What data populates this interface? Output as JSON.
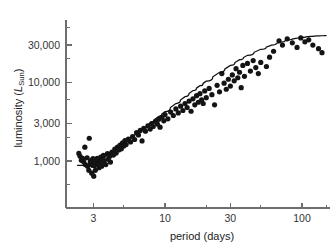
{
  "chart_data": {
    "type": "scatter",
    "title": "",
    "subtitle": "",
    "xlabel": "period (days)",
    "ylabel": "luminosity (L_Sun)",
    "ylabel_parts": {
      "prefix": "luminosity (",
      "symbol": "L",
      "subscript": "Sun",
      "suffix": ")"
    },
    "xscale": "log",
    "yscale": "log",
    "xlim": [
      2.1,
      160
    ],
    "ylim": [
      330,
      62000
    ],
    "grid": false,
    "legend": null,
    "legend_position": "none",
    "xticks": [
      3,
      10,
      30,
      100
    ],
    "xtick_labels": [
      "3",
      "10",
      "30",
      "100"
    ],
    "xminor_ticks": [
      5,
      20,
      50,
      150
    ],
    "yticks": [
      1000,
      3000,
      10000,
      30000
    ],
    "ytick_labels": [
      "1,000",
      "3,000",
      "10,000",
      "30,000"
    ],
    "yminor_ticks": [
      500,
      2000,
      6000,
      20000,
      50000
    ],
    "point_color": "#141414",
    "curve_color": "#111111",
    "axis_color": "#6e6e6e",
    "point_radius": 2.6,
    "series": [
      {
        "name": "Cepheid variables",
        "marker": "circle",
        "points": [
          [
            2.35,
            1250
          ],
          [
            2.4,
            1150
          ],
          [
            2.45,
            1020
          ],
          [
            2.5,
            1080
          ],
          [
            2.55,
            980
          ],
          [
            2.6,
            1500
          ],
          [
            2.62,
            900
          ],
          [
            2.7,
            1100
          ],
          [
            2.72,
            860
          ],
          [
            2.78,
            760
          ],
          [
            2.8,
            1950
          ],
          [
            2.85,
            980
          ],
          [
            2.88,
            930
          ],
          [
            2.9,
            1020
          ],
          [
            2.92,
            700
          ],
          [
            2.95,
            880
          ],
          [
            2.98,
            1070
          ],
          [
            3.0,
            950
          ],
          [
            3.02,
            640
          ],
          [
            3.05,
            870
          ],
          [
            3.08,
            1010
          ],
          [
            3.1,
            760
          ],
          [
            3.15,
            930
          ],
          [
            3.2,
            1080
          ],
          [
            3.25,
            900
          ],
          [
            3.3,
            820
          ],
          [
            3.35,
            1000
          ],
          [
            3.4,
            1120
          ],
          [
            3.45,
            860
          ],
          [
            3.5,
            950
          ],
          [
            3.55,
            1180
          ],
          [
            3.6,
            1010
          ],
          [
            3.7,
            900
          ],
          [
            3.8,
            1240
          ],
          [
            3.85,
            1050
          ],
          [
            3.95,
            1150
          ],
          [
            4.0,
            970
          ],
          [
            4.1,
            1300
          ],
          [
            4.2,
            1190
          ],
          [
            4.3,
            1420
          ],
          [
            4.4,
            1260
          ],
          [
            4.5,
            1500
          ],
          [
            4.6,
            1380
          ],
          [
            4.7,
            1600
          ],
          [
            4.8,
            1430
          ],
          [
            4.9,
            1700
          ],
          [
            5.0,
            1550
          ],
          [
            5.1,
            1820
          ],
          [
            5.2,
            1620
          ],
          [
            5.4,
            1900
          ],
          [
            5.6,
            1750
          ],
          [
            5.8,
            2050
          ],
          [
            6.0,
            1880
          ],
          [
            6.2,
            2300
          ],
          [
            6.4,
            2150
          ],
          [
            6.6,
            2450
          ],
          [
            6.8,
            1800
          ],
          [
            7.0,
            2600
          ],
          [
            7.2,
            2400
          ],
          [
            7.5,
            2800
          ],
          [
            7.8,
            2550
          ],
          [
            8.0,
            3000
          ],
          [
            8.2,
            2750
          ],
          [
            8.5,
            3200
          ],
          [
            8.8,
            2950
          ],
          [
            9.0,
            3400
          ],
          [
            9.2,
            2700
          ],
          [
            9.5,
            3600
          ],
          [
            9.8,
            3250
          ],
          [
            10.0,
            3900
          ],
          [
            10.5,
            3450
          ],
          [
            11.0,
            4200
          ],
          [
            11.5,
            3800
          ],
          [
            12.0,
            4600
          ],
          [
            12.5,
            4100
          ],
          [
            13.0,
            5000
          ],
          [
            13.5,
            4400
          ],
          [
            14.0,
            5400
          ],
          [
            14.5,
            4800
          ],
          [
            15.0,
            5800
          ],
          [
            15.5,
            4300
          ],
          [
            16.0,
            6200
          ],
          [
            16.5,
            5200
          ],
          [
            17.0,
            6800
          ],
          [
            17.5,
            5600
          ],
          [
            18.0,
            7200
          ],
          [
            18.5,
            6000
          ],
          [
            19.0,
            5400
          ],
          [
            19.5,
            7800
          ],
          [
            20.0,
            6400
          ],
          [
            21.0,
            8400
          ],
          [
            22.0,
            7000
          ],
          [
            23.0,
            5200
          ],
          [
            24.0,
            9200
          ],
          [
            25.0,
            7600
          ],
          [
            26.0,
            13000
          ],
          [
            27.0,
            9800
          ],
          [
            28.0,
            8200
          ],
          [
            29.0,
            11000
          ],
          [
            30.0,
            9000
          ],
          [
            31.0,
            12500
          ],
          [
            32.0,
            10500
          ],
          [
            33.0,
            15000
          ],
          [
            34.0,
            11500
          ],
          [
            35.0,
            13500
          ],
          [
            36.0,
            8600
          ],
          [
            37.0,
            16500
          ],
          [
            38.0,
            12000
          ],
          [
            40.0,
            17500
          ],
          [
            42.0,
            14000
          ],
          [
            44.0,
            19000
          ],
          [
            46.0,
            15500
          ],
          [
            48.0,
            13000
          ],
          [
            50.0,
            18000
          ],
          [
            55.0,
            16000
          ],
          [
            58.0,
            21000
          ],
          [
            62.0,
            25000
          ],
          [
            68.0,
            34000
          ],
          [
            72.0,
            30000
          ],
          [
            78.0,
            36000
          ],
          [
            85.0,
            32000
          ],
          [
            92.0,
            28000
          ],
          [
            98.0,
            37000
          ],
          [
            105.0,
            33000
          ],
          [
            112.0,
            35000
          ],
          [
            120.0,
            30000
          ],
          [
            132.0,
            27000
          ],
          [
            140.0,
            24000
          ]
        ]
      }
    ],
    "fit_curve": {
      "name": "period-luminosity relation",
      "description": "fitted trend line flattening at long periods",
      "points": [
        [
          2.3,
          880
        ],
        [
          2.6,
          880
        ],
        [
          3.0,
          940
        ],
        [
          3.5,
          1100
        ],
        [
          4.0,
          1300
        ],
        [
          4.5,
          1500
        ],
        [
          5.0,
          1720
        ],
        [
          6.0,
          2150
        ],
        [
          7.0,
          2650
        ],
        [
          8.0,
          3150
        ],
        [
          9.0,
          3700
        ],
        [
          10.0,
          4250
        ],
        [
          12.0,
          5400
        ],
        [
          14.0,
          6600
        ],
        [
          16.0,
          7900
        ],
        [
          18.0,
          9100
        ],
        [
          20.0,
          10400
        ],
        [
          25.0,
          13500
        ],
        [
          30.0,
          16500
        ],
        [
          35.0,
          19500
        ],
        [
          40.0,
          22200
        ],
        [
          50.0,
          26500
        ],
        [
          60.0,
          30000
        ],
        [
          70.0,
          32800
        ],
        [
          80.0,
          35000
        ],
        [
          90.0,
          36500
        ],
        [
          100.0,
          37600
        ],
        [
          115.0,
          38600
        ],
        [
          130.0,
          39200
        ],
        [
          150.0,
          39600
        ]
      ]
    }
  },
  "axes_geometry": {
    "plot_left_px": 66,
    "plot_bottom_px": 208,
    "x_decade_px": 137,
    "y_decade_px": 78.5,
    "x_ref_value": 10,
    "x_ref_px": 165,
    "y_ref_value": 1000,
    "y_ref_px": 161
  }
}
